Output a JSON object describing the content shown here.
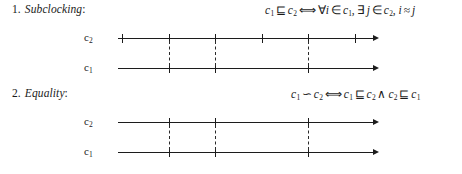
{
  "sections": [
    {
      "number": "1.",
      "title": "Subclocking",
      "colon": ":",
      "formula": {
        "lhs_var": "c",
        "lhs_sub": "1",
        "relation": "⊑",
        "rhs_var": "c",
        "rhs_sub": "2",
        "iff": "⟺",
        "forall": "∀",
        "forall_var": "i",
        "in1": "∈",
        "set1_var": "c",
        "set1_sub": "1",
        "comma1": ",",
        "exists": "∃",
        "exists_var": "j",
        "in2": "∈",
        "set2_var": "c",
        "set2_sub": "2",
        "comma2": ",",
        "left_var": "i",
        "approx": "≈",
        "right_var": "j",
        "plain": "c₁ ⊑ c₂ ⟺ ∀i ∈ c₁, ∃j ∈ c₂, i ≈ j"
      },
      "diagram": {
        "top_clock_label": "c",
        "top_clock_sub": "2",
        "bottom_clock_label": "c",
        "bottom_clock_sub": "1",
        "top_ticks": [
          122,
          169,
          215,
          262,
          308,
          355
        ],
        "bottom_ticks": [
          169,
          215,
          308
        ],
        "dashed_links": [
          169,
          215,
          308
        ],
        "axis_start": 118,
        "axis_end": 376,
        "arrow": "→"
      }
    },
    {
      "number": "2.",
      "title": "Equality",
      "colon": ":",
      "formula": {
        "lhs_var": "c",
        "lhs_sub": "1",
        "relation": "∽",
        "rhs_var": "c",
        "rhs_sub": "2",
        "iff": "⟺",
        "t1_var": "c",
        "t1_sub": "1",
        "sub1": "⊑",
        "t2_var": "c",
        "t2_sub": "2",
        "and": "∧",
        "t3_var": "c",
        "t3_sub": "2",
        "sub2": "⊑",
        "t4_var": "c",
        "t4_sub": "1",
        "plain": "c₁ ∽ c₂ ⟺ c₁ ⊑ c₂ ∧ c₂ ⊑ c₁"
      },
      "diagram": {
        "top_clock_label": "c",
        "top_clock_sub": "2",
        "bottom_clock_label": "c",
        "bottom_clock_sub": "1",
        "top_ticks": [
          169,
          215,
          308
        ],
        "bottom_ticks": [
          169,
          215,
          308
        ],
        "dashed_links": [
          169,
          215,
          308
        ],
        "axis_start": 118,
        "axis_end": 376,
        "arrow": "→"
      }
    }
  ],
  "colors": {
    "ink": "#1c1c1c",
    "background": "#ffffff",
    "dashed": "#2a2a2a"
  }
}
